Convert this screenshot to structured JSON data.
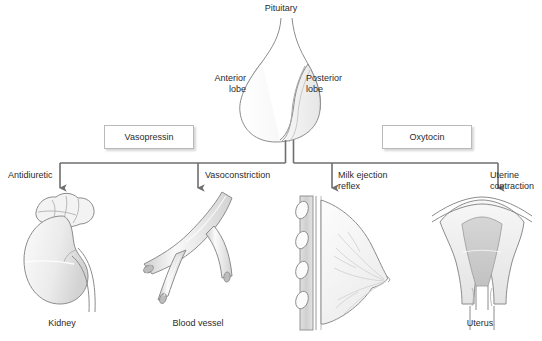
{
  "diagram": {
    "title": "Pituitary",
    "gland": {
      "anterior_label": "Anterior\nlobe",
      "posterior_label": "Posterior\nlobe"
    },
    "hormones": [
      {
        "name": "Vasopressin",
        "x": 104,
        "y": 125,
        "w": 88,
        "h": 22
      },
      {
        "name": "Oxytocin",
        "x": 382,
        "y": 125,
        "w": 88,
        "h": 22
      }
    ],
    "effects": [
      {
        "label": "Antidiuretic",
        "x": 8,
        "y": 170,
        "align": "left"
      },
      {
        "label": "Vasoconstriction",
        "x": 205,
        "y": 170,
        "align": "left"
      },
      {
        "label": "Milk ejection\nreflex",
        "x": 338,
        "y": 170,
        "align": "left"
      },
      {
        "label": "Uterine\ncontraction",
        "x": 490,
        "y": 170,
        "align": "left"
      }
    ],
    "organs": [
      {
        "caption": "Kidney",
        "x": 62,
        "y": 318
      },
      {
        "caption": "Blood vessel",
        "x": 198,
        "y": 318
      },
      {
        "caption": "Uterus",
        "x": 480,
        "y": 318
      }
    ],
    "colors": {
      "stroke": "#8c8c8c",
      "connector": "#6f6f6f",
      "fill_light": "#f4f4f4",
      "fill_mid": "#dcdcdc",
      "fill_dark": "#c4c4c4",
      "text": "#2b2b2b",
      "box_border": "#b9b9b9"
    }
  }
}
